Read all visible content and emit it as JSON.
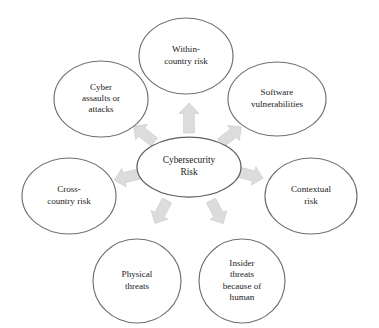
{
  "diagram": {
    "type": "radial-hub-and-spoke",
    "center": {
      "id": "cybersecurity-risk",
      "lines": [
        "Cybersecurity",
        "Risk"
      ],
      "cx": 189,
      "cy": 167,
      "rx": 52,
      "ry": 30
    },
    "arrow_color": "#dcdcdc",
    "ellipse_stroke_color": "#6f6f6f",
    "text_color": "#1b1b1b",
    "background_color": "#ffffff",
    "nodes": [
      {
        "id": "within-country-risk",
        "lines": [
          "Within-",
          "country risk"
        ],
        "cx": 186,
        "cy": 56,
        "rx": 47,
        "ry": 38,
        "angle_deg": -90
      },
      {
        "id": "software-vulnerabilities",
        "lines": [
          "Software",
          "vulnerabilities"
        ],
        "cx": 277,
        "cy": 99,
        "rx": 49,
        "ry": 37,
        "angle_deg": -38
      },
      {
        "id": "contextual-risk",
        "lines": [
          "Contextual",
          "risk"
        ],
        "cx": 311,
        "cy": 196,
        "rx": 46,
        "ry": 38,
        "angle_deg": 14
      },
      {
        "id": "insider-threats-because-of-human",
        "lines": [
          "Insider",
          "threats",
          "because of",
          "human"
        ],
        "cx": 242,
        "cy": 281,
        "rx": 43,
        "ry": 42,
        "angle_deg": 62
      },
      {
        "id": "physical-threats",
        "lines": [
          "Physical",
          "threats"
        ],
        "cx": 137,
        "cy": 281,
        "rx": 44,
        "ry": 42,
        "angle_deg": 118
      },
      {
        "id": "cross-country-risk",
        "lines": [
          "Cross-",
          "country risk"
        ],
        "cx": 69,
        "cy": 196,
        "rx": 47,
        "ry": 38,
        "angle_deg": 166
      },
      {
        "id": "cyber-assaults-or-attacks",
        "lines": [
          "Cyber",
          "assaults or",
          "attacks"
        ],
        "cx": 101,
        "cy": 99,
        "rx": 47,
        "ry": 38,
        "angle_deg": -142
      }
    ],
    "arrows": [
      {
        "id": "arrow-to-within-country-risk",
        "cx": 189,
        "cy": 118,
        "angle_deg": -90,
        "length": 30,
        "width": 20
      },
      {
        "id": "arrow-to-software-vulnerabilities",
        "cx": 231,
        "cy": 135,
        "angle_deg": -38,
        "length": 26,
        "width": 19
      },
      {
        "id": "arrow-to-contextual-risk",
        "cx": 250,
        "cy": 175,
        "angle_deg": 14,
        "length": 27,
        "width": 19
      },
      {
        "id": "arrow-to-insider-threats",
        "cx": 217,
        "cy": 212,
        "angle_deg": 62,
        "length": 26,
        "width": 19
      },
      {
        "id": "arrow-to-physical-threats",
        "cx": 161,
        "cy": 212,
        "angle_deg": 118,
        "length": 26,
        "width": 19
      },
      {
        "id": "arrow-to-cross-country-risk",
        "cx": 127,
        "cy": 177,
        "angle_deg": 166,
        "length": 26,
        "width": 19
      },
      {
        "id": "arrow-to-cyber-assaults",
        "cx": 144,
        "cy": 134,
        "angle_deg": -142,
        "length": 26,
        "width": 19
      }
    ]
  }
}
